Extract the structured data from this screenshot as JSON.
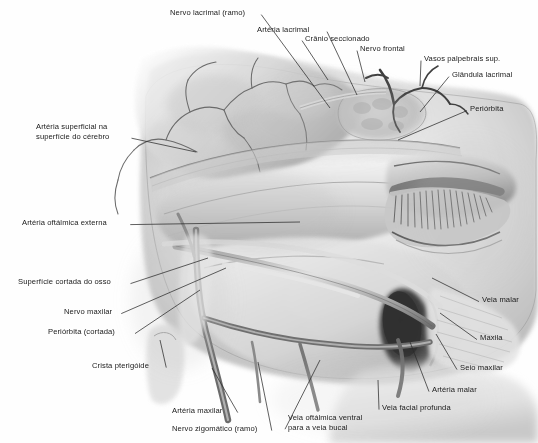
{
  "figure": {
    "style": "grayscale pencil anatomical illustration",
    "language": "pt-BR",
    "palette": {
      "background": "#ffffff",
      "paper": "#fefefe",
      "tissue_light": "#e8e8e8",
      "tissue_mid": "#c2c2c2",
      "tissue_dark": "#8d8d8d",
      "shadow": "#5a5a5a",
      "sinus_dark": "#3a3a3a",
      "vessel": "#6e6e6e",
      "leader_line": "#2b2b2b",
      "text": "#1a1a1a"
    }
  },
  "labels": [
    {
      "id": "nervo-lacrimal-ramo",
      "text": "Nervo lacrimal (ramo)",
      "x": 170,
      "y": 8,
      "anchor": "left",
      "tip_x": 330,
      "tip_y": 108
    },
    {
      "id": "arteria-lacrimal",
      "text": "Artéria lacrimal",
      "x": 257,
      "y": 25,
      "anchor": "left",
      "tip_x": 357,
      "tip_y": 95
    },
    {
      "id": "cranio-seccionado",
      "text": "Crânio seccionado",
      "x": 305,
      "y": 34,
      "anchor": "left",
      "tip_x": 328,
      "tip_y": 80
    },
    {
      "id": "nervo-frontal",
      "text": "Nervo frontal",
      "x": 360,
      "y": 44,
      "anchor": "left",
      "tip_x": 365,
      "tip_y": 82
    },
    {
      "id": "vasos-palpebrais-sup",
      "text": "Vasos palpebrais sup.",
      "x": 424,
      "y": 54,
      "anchor": "left",
      "tip_x": 420,
      "tip_y": 86
    },
    {
      "id": "glandula-lacrimal",
      "text": "Glândula lacrimal",
      "x": 452,
      "y": 70,
      "anchor": "left",
      "tip_x": 420,
      "tip_y": 112
    },
    {
      "id": "periorbita",
      "text": "Periórbita",
      "x": 470,
      "y": 104,
      "anchor": "left",
      "tip_x": 398,
      "tip_y": 140
    },
    {
      "id": "arteria-superficial",
      "text": "Artéria superficial na\nsuperfície do cérebro",
      "x": 36,
      "y": 122,
      "anchor": "left",
      "tip_x": 196,
      "tip_y": 152
    },
    {
      "id": "arteria-oftalmica-ext",
      "text": "Artéria oftálmica externa",
      "x": 22,
      "y": 218,
      "anchor": "left",
      "tip_x": 300,
      "tip_y": 222
    },
    {
      "id": "superficie-cortada",
      "text": "Superfície cortada do osso",
      "x": 18,
      "y": 277,
      "anchor": "left",
      "tip_x": 208,
      "tip_y": 258
    },
    {
      "id": "nervo-maxilar",
      "text": "Nervo maxilar",
      "x": 64,
      "y": 307,
      "anchor": "left",
      "tip_x": 226,
      "tip_y": 268
    },
    {
      "id": "periorbita-cortada",
      "text": "Periórbita (cortada)",
      "x": 48,
      "y": 327,
      "anchor": "left",
      "tip_x": 200,
      "tip_y": 290
    },
    {
      "id": "crista-pterigoide",
      "text": "Crista pterigóide",
      "x": 92,
      "y": 361,
      "anchor": "left",
      "tip_x": 160,
      "tip_y": 340
    },
    {
      "id": "veia-malar",
      "text": "Veia malar",
      "x": 482,
      "y": 295,
      "anchor": "left",
      "tip_x": 432,
      "tip_y": 278
    },
    {
      "id": "maxila",
      "text": "Maxila",
      "x": 480,
      "y": 333,
      "anchor": "left",
      "tip_x": 440,
      "tip_y": 313
    },
    {
      "id": "seio-maxilar",
      "text": "Seio maxilar",
      "x": 460,
      "y": 363,
      "anchor": "left",
      "tip_x": 436,
      "tip_y": 334
    },
    {
      "id": "arteria-malar",
      "text": "Artéria malar",
      "x": 432,
      "y": 385,
      "anchor": "left",
      "tip_x": 410,
      "tip_y": 342
    },
    {
      "id": "veia-facial-profunda",
      "text": "Veia facial profunda",
      "x": 382,
      "y": 403,
      "anchor": "left",
      "tip_x": 378,
      "tip_y": 380
    },
    {
      "id": "arteria-maxilar",
      "text": "Artéria maxilar",
      "x": 172,
      "y": 406,
      "anchor": "left",
      "tip_x": 212,
      "tip_y": 368
    },
    {
      "id": "nervo-zigomatico-ramo",
      "text": "Nervo zigomático (ramo)",
      "x": 172,
      "y": 424,
      "anchor": "left",
      "tip_x": 258,
      "tip_y": 362
    },
    {
      "id": "veia-oftalmica-ventral",
      "text": "Veia oftálmica ventral\npara a veia bucal",
      "x": 288,
      "y": 413,
      "anchor": "left",
      "tip_x": 320,
      "tip_y": 360
    }
  ]
}
